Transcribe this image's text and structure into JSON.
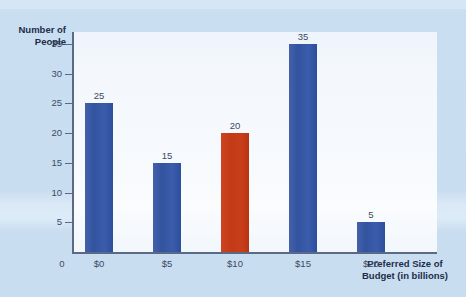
{
  "chart_data": {
    "type": "bar",
    "title": "",
    "subtitle": "",
    "categories": [
      "$0",
      "$5",
      "$10",
      "$15",
      "$20"
    ],
    "values": [
      25,
      15,
      20,
      35,
      5
    ],
    "bar_colors": [
      "#32549f",
      "#32549f",
      "#c33a17",
      "#32549f",
      "#32549f"
    ],
    "highlight_index": 2,
    "highlight_color": "#c33a17",
    "series_color": "#32549f",
    "xlabel": "Preferred Size of Budget (in billions)",
    "xlabel_line1": "Preferred Size of",
    "xlabel_line2": "Budget (in billions)",
    "ylabel": "Number of People",
    "ylabel_line1": "Number of",
    "ylabel_line2": "People",
    "ylim": [
      0,
      37
    ],
    "yticks": [
      0,
      5,
      10,
      15,
      20,
      25,
      30,
      35
    ],
    "ytick_labels": [
      "0",
      "5",
      "10",
      "15",
      "20",
      "25",
      "30",
      "35"
    ],
    "origin_label": "0",
    "data_labels": [
      "25",
      "15",
      "20",
      "35",
      "5"
    ],
    "grid": false,
    "legend": "none",
    "background_color": "#c9ddf0",
    "plot_background_color": "#f6f9fd",
    "axis_color": "#5a6a86",
    "text_color": "#3b4a63"
  }
}
